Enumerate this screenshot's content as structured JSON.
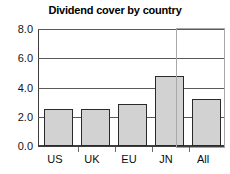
{
  "chart_data": {
    "type": "bar",
    "title": "Dividend cover by country",
    "xlabel": "",
    "ylabel": "",
    "categories": [
      "US",
      "UK",
      "EU",
      "JN",
      "All"
    ],
    "values": [
      2.5,
      2.5,
      2.9,
      4.8,
      3.2
    ],
    "series": [
      {
        "name": "Dividend cover",
        "values": [
          2.5,
          2.5,
          2.9,
          4.8,
          3.2
        ]
      }
    ],
    "ylim": [
      0.0,
      8.0
    ],
    "ytick_labels": [
      "0.0",
      "2.0",
      "4.0",
      "6.0",
      "8.0"
    ],
    "ytick_values": [
      0.0,
      2.0,
      4.0,
      6.0,
      8.0
    ],
    "grid": "horizontal",
    "legend": "none",
    "annotations": [
      {
        "type": "highlight-box",
        "target_category": "All",
        "description": "Grey rectangle outlining the All column"
      }
    ],
    "colors": {
      "bar_fill": "#d2d2d2",
      "bar_border": "#2a2a2a",
      "axis": "#3d3d3d",
      "gridline": "#5a5a5a",
      "highlight_border": "#a8a8a8",
      "text": "#000000",
      "background": "#ffffff"
    }
  }
}
